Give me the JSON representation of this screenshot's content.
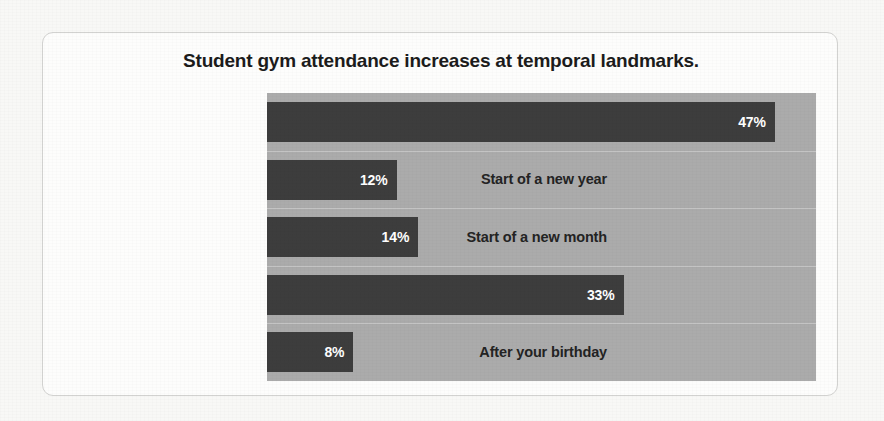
{
  "card": {
    "title": "Student gym attendance increases at temporal landmarks."
  },
  "colors": {
    "bar": "#3d3d3d",
    "plot_background": "#ababab",
    "card_background": "#fdfdfc",
    "page_background": "#f8f8f6",
    "title_text": "#1b1b1b",
    "label_text": "#232323",
    "value_text": "#ffffff"
  },
  "chart_data": {
    "type": "bar",
    "orientation": "horizontal",
    "title": "Student gym attendance increases at temporal landmarks.",
    "xlabel": "",
    "ylabel": "",
    "categories": [
      "Start of a new semester",
      "Start of a new year",
      "Start of a new month",
      "Start of a new week",
      "After your birthday"
    ],
    "values": [
      47,
      12,
      14,
      33,
      8
    ],
    "value_labels": [
      "47%",
      "12%",
      "14%",
      "33%",
      "8%"
    ],
    "unit": "%",
    "xlim": [
      0,
      50.8
    ],
    "grid": true,
    "legend": false
  }
}
